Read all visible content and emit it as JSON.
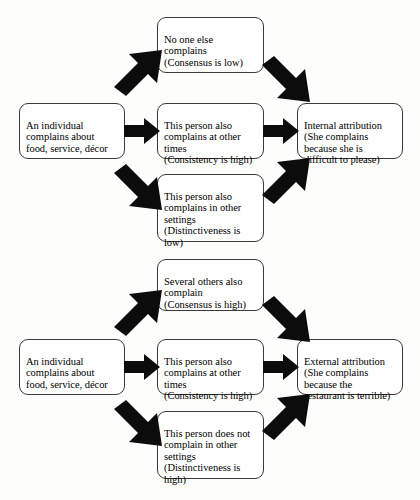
{
  "diagram": {
    "background_color": "#fdfdfb",
    "box_border_color": "#3a3a3a",
    "arrow_color": "#0c0c0c",
    "text_color": "#000000"
  },
  "flows": [
    {
      "id": "internal",
      "source": {
        "label": "An individual\ncomplains about\nfood, service, décor"
      },
      "conditions": [
        {
          "label": "No one else\ncomplains\n(Consensus is low)",
          "dimension": "Consensus",
          "level": "low"
        },
        {
          "label": "This person also\ncomplains at other\ntimes\n(Consistency is high)",
          "dimension": "Consistency",
          "level": "high"
        },
        {
          "label": "This person also\ncomplains in other\nsettings\n(Distinctiveness is\nlow)",
          "dimension": "Distinctiveness",
          "level": "low"
        }
      ],
      "outcome": {
        "label": "Internal attribution\n(She complains\nbecause she is\ndifficult to please)"
      }
    },
    {
      "id": "external",
      "source": {
        "label": "An individual\ncomplains about\nfood, service, décor"
      },
      "conditions": [
        {
          "label": "Several others also\ncomplain\n(Consensus is high)",
          "dimension": "Consensus",
          "level": "high"
        },
        {
          "label": "This person also\ncomplains at other\ntimes\n(Consistency is high)",
          "dimension": "Consistency",
          "level": "high"
        },
        {
          "label": "This person does not\ncomplain in other\nsettings\n(Distinctiveness is\nhigh)",
          "dimension": "Distinctiveness",
          "level": "high"
        }
      ],
      "outcome": {
        "label": "External attribution\n(She complains\nbecause the\nrestaurant is terrible)"
      }
    }
  ],
  "arrows": [
    {
      "name": "arrow-internal-source-to-consensus",
      "direction": "up-right"
    },
    {
      "name": "arrow-internal-source-to-consistency",
      "direction": "right"
    },
    {
      "name": "arrow-internal-source-to-distinctiveness",
      "direction": "down-right"
    },
    {
      "name": "arrow-internal-consensus-to-outcome",
      "direction": "down-right"
    },
    {
      "name": "arrow-internal-consistency-to-outcome",
      "direction": "right"
    },
    {
      "name": "arrow-internal-distinctiveness-to-outcome",
      "direction": "up-right"
    },
    {
      "name": "arrow-external-source-to-consensus",
      "direction": "up-right"
    },
    {
      "name": "arrow-external-source-to-consistency",
      "direction": "right"
    },
    {
      "name": "arrow-external-source-to-distinctiveness",
      "direction": "down-right"
    },
    {
      "name": "arrow-external-consensus-to-outcome",
      "direction": "down-right"
    },
    {
      "name": "arrow-external-consistency-to-outcome",
      "direction": "right"
    },
    {
      "name": "arrow-external-distinctiveness-to-outcome",
      "direction": "up-right"
    }
  ]
}
